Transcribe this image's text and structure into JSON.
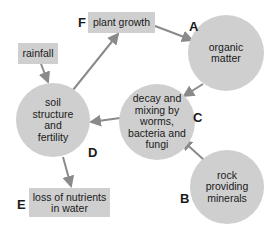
{
  "diagram": {
    "nodes": {
      "rainfall": {
        "label": "rainfall"
      },
      "plant_growth": {
        "label": "plant growth",
        "letter": "F"
      },
      "organic_matter": {
        "label": "organic matter",
        "letter": "A"
      },
      "decay": {
        "label": "decay and mixing by worms, bacteria and fungi",
        "letter": "C"
      },
      "soil": {
        "label": "soil structure and fertility",
        "letter": "D"
      },
      "rock": {
        "label": "rock providing minerals",
        "letter": "B"
      },
      "loss": {
        "label": "loss of nutrients in water",
        "letter": "E"
      }
    },
    "edges": [
      {
        "from": "rainfall",
        "to": "soil"
      },
      {
        "from": "soil",
        "to": "plant_growth"
      },
      {
        "from": "plant_growth",
        "to": "organic_matter"
      },
      {
        "from": "organic_matter",
        "to": "decay"
      },
      {
        "from": "decay",
        "to": "soil"
      },
      {
        "from": "rock",
        "to": "decay"
      },
      {
        "from": "soil",
        "to": "loss"
      }
    ],
    "colors": {
      "node_fill": "#cfcfcf",
      "arrow": "#8a8a8a"
    }
  }
}
